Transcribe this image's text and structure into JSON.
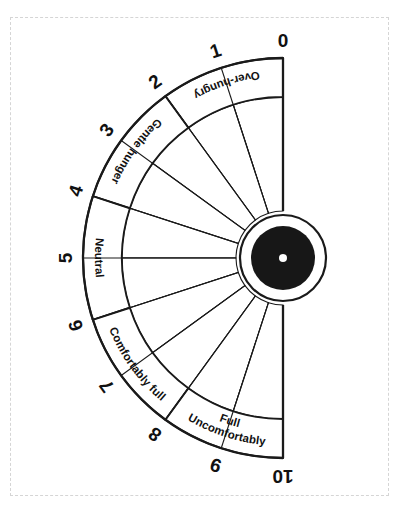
{
  "page": {
    "background_color": "#ffffff",
    "frame_border_color": "#d5d5d5",
    "ink_color": "#1a1a1a",
    "hub_color": "#171717"
  },
  "dial": {
    "type": "semicircular-gauge",
    "center": {
      "x": 283,
      "y": 258
    },
    "hub_disc_radius": 32,
    "hub_dot_radius": 4,
    "hub_ring_radius": 43,
    "wedge_inner_radius": 47,
    "wedge_outer_radius": 161,
    "band_outer_radius": 200,
    "number_radius": 218,
    "start_angle_deg": 90,
    "end_angle_deg": 270,
    "tick_count": 11
  },
  "ticks": [
    {
      "value": "0",
      "angle": 90
    },
    {
      "value": "1",
      "angle": 108
    },
    {
      "value": "2",
      "angle": 126
    },
    {
      "value": "3",
      "angle": 144
    },
    {
      "value": "4",
      "angle": 162
    },
    {
      "value": "5",
      "angle": 180
    },
    {
      "value": "6",
      "angle": 198
    },
    {
      "value": "7",
      "angle": 216
    },
    {
      "value": "8",
      "angle": 234
    },
    {
      "value": "9",
      "angle": 252
    },
    {
      "value": "10",
      "angle": 270
    }
  ],
  "bands": [
    {
      "id": "over-hungry",
      "label": "Over-hungry",
      "label_lines": [
        "Over-hungry"
      ],
      "from_value": "0",
      "to_value": "2",
      "start_angle": 90,
      "end_angle": 126
    },
    {
      "id": "gentle-hunger",
      "label": "Gentle hunger",
      "label_lines": [
        "Gentle hunger"
      ],
      "from_value": "2",
      "to_value": "4",
      "start_angle": 126,
      "end_angle": 162
    },
    {
      "id": "neutral",
      "label": "Neutral",
      "label_lines": [
        "Neutral"
      ],
      "from_value": "4",
      "to_value": "6",
      "start_angle": 162,
      "end_angle": 198
    },
    {
      "id": "comfortably-full",
      "label": "Comfortably full",
      "label_lines": [
        "Comfortably full"
      ],
      "from_value": "6",
      "to_value": "8",
      "start_angle": 198,
      "end_angle": 234
    },
    {
      "id": "uncomfortably-full",
      "label": "Uncomfortably Full",
      "label_lines": [
        "Uncomfortably",
        "Full"
      ],
      "from_value": "8",
      "to_value": "10",
      "start_angle": 234,
      "end_angle": 270
    }
  ],
  "chart_data": {
    "type": "pie",
    "categories": [
      "Over-hungry",
      "Gentle hunger",
      "Neutral",
      "Comfortably full",
      "Uncomfortably Full"
    ],
    "values": [
      2,
      2,
      2,
      2,
      2
    ],
    "tick_labels": [
      "0",
      "1",
      "2",
      "3",
      "4",
      "5",
      "6",
      "7",
      "8",
      "9",
      "10"
    ],
    "xlabel": "",
    "ylabel": "",
    "grid": false,
    "legend": "none"
  }
}
